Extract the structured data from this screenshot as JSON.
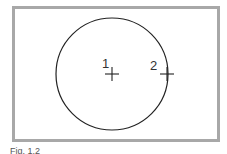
{
  "diagram": {
    "labels": [
      {
        "id": "point-1",
        "text": "1",
        "x": 103,
        "y": 64
      },
      {
        "id": "point-2",
        "text": "2",
        "x": 152,
        "y": 66
      }
    ],
    "circle": {
      "cx": 112,
      "cy": 74,
      "r": 56
    },
    "markers": [
      {
        "id": "center-marker",
        "x": 112,
        "y": 74
      },
      {
        "id": "edge-marker",
        "x": 167,
        "y": 74
      }
    ]
  },
  "caption": "Fig. 1.2"
}
